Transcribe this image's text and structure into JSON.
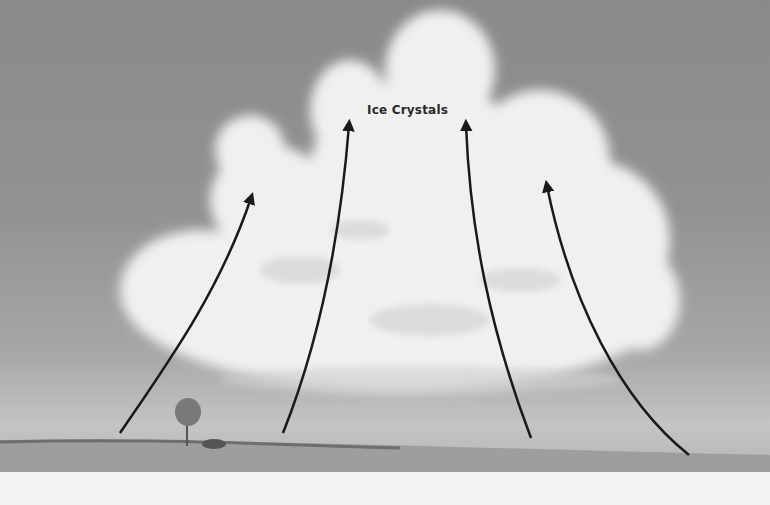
{
  "illustration": {
    "subject": "Cumulus cloud with rising air currents",
    "label": "Ice Crystals",
    "arrows": 4,
    "colors": {
      "sky": "#8e8e8e",
      "cloud": "#f2f2f2",
      "arrow": "#1a1a1a",
      "ground": "#9a9a9a",
      "margin": "#f3f3f3"
    }
  }
}
